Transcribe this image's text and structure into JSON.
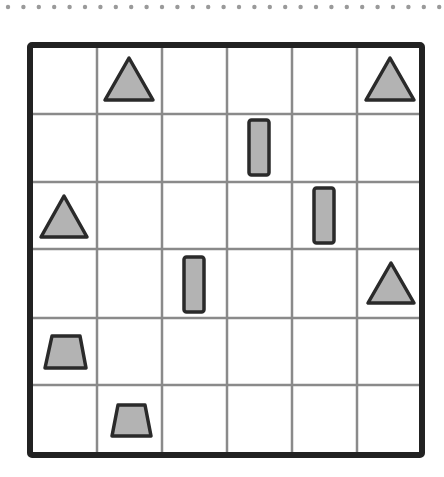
{
  "colors": {
    "background": "#ffffff",
    "dots": "#9a9a9a",
    "border": "#222222",
    "grid_line": "#8a8a8a",
    "shape_fill": "#b3b3b3",
    "shape_stroke": "#2a2a2a"
  },
  "dots": {
    "y": 7,
    "start_x": 8,
    "spacing": 15.4,
    "count": 29,
    "radius": 2.2
  },
  "grid": {
    "rows": 6,
    "cols": 6,
    "outer": {
      "x": 30,
      "y": 45,
      "width": 392,
      "height": 410
    },
    "border_width": 6,
    "line_width": 2.5,
    "col_lines": [
      97,
      162,
      227,
      292,
      357
    ],
    "row_lines": [
      114,
      182,
      249,
      318,
      385
    ]
  },
  "shapes": [
    {
      "type": "triangle",
      "row": 0,
      "col": 1,
      "points": [
        [
          129,
          58
        ],
        [
          105,
          100
        ],
        [
          153,
          100
        ]
      ]
    },
    {
      "type": "triangle",
      "row": 0,
      "col": 5,
      "points": [
        [
          390,
          58
        ],
        [
          366,
          100
        ],
        [
          414,
          100
        ]
      ]
    },
    {
      "type": "rectangle",
      "row": 1,
      "col": 3,
      "x": 249,
      "y": 120,
      "width": 20,
      "height": 55
    },
    {
      "type": "triangle",
      "row": 2,
      "col": 0,
      "points": [
        [
          64,
          196
        ],
        [
          41,
          237
        ],
        [
          87,
          237
        ]
      ]
    },
    {
      "type": "rectangle",
      "row": 2,
      "col": 4,
      "x": 314,
      "y": 188,
      "width": 20,
      "height": 55
    },
    {
      "type": "rectangle",
      "row": 3,
      "col": 2,
      "x": 184,
      "y": 257,
      "width": 20,
      "height": 55
    },
    {
      "type": "triangle",
      "row": 3,
      "col": 5,
      "points": [
        [
          391,
          263
        ],
        [
          368,
          303
        ],
        [
          414,
          303
        ]
      ]
    },
    {
      "type": "trapezoid",
      "row": 4,
      "col": 0,
      "points": [
        [
          52,
          336
        ],
        [
          80,
          336
        ],
        [
          86,
          368
        ],
        [
          45,
          368
        ]
      ]
    },
    {
      "type": "trapezoid",
      "row": 5,
      "col": 1,
      "points": [
        [
          118,
          405
        ],
        [
          145,
          405
        ],
        [
          151,
          436
        ],
        [
          112,
          436
        ]
      ]
    }
  ]
}
